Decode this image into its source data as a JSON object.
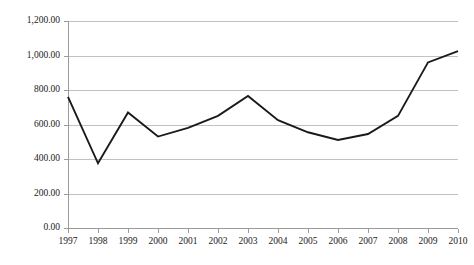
{
  "chart_data": {
    "type": "line",
    "title": "",
    "subtitle": "",
    "xlabel": "",
    "ylabel": "",
    "categories": [
      "1997",
      "1998",
      "1999",
      "2000",
      "2001",
      "2002",
      "2003",
      "2004",
      "2005",
      "2006",
      "2007",
      "2008",
      "2009",
      "2010"
    ],
    "x": [
      1997,
      1998,
      1999,
      2000,
      2001,
      2002,
      2003,
      2004,
      2005,
      2006,
      2007,
      2008,
      2009,
      2010
    ],
    "values": [
      760,
      375,
      670,
      530,
      580,
      650,
      765,
      625,
      555,
      510,
      545,
      650,
      960,
      1025
    ],
    "series": [
      {
        "name": "",
        "color": "#1a1a1a",
        "values": [
          760,
          375,
          670,
          530,
          580,
          650,
          765,
          625,
          555,
          510,
          545,
          650,
          960,
          1025
        ]
      }
    ],
    "ylim": [
      0,
      1200
    ],
    "xlim": [
      1997,
      2010
    ],
    "yticks": [
      0,
      200,
      400,
      600,
      800,
      1000,
      1200
    ],
    "ytick_labels": [
      "0.00",
      "200.00",
      "400.00",
      "600.00",
      "800.00",
      "1,000.00",
      "1,200.00"
    ],
    "xtick_labels": [
      "1997",
      "1998",
      "1999",
      "2000",
      "2001",
      "2002",
      "2003",
      "2004",
      "2005",
      "2006",
      "2007",
      "2008",
      "2009",
      "2010"
    ],
    "grid": {
      "horizontal": true,
      "vertical": false,
      "color": "#b3b3b3"
    },
    "legend": {
      "visible": false,
      "position": "none",
      "entries": []
    },
    "annotations": [],
    "colors": {
      "line": "#1a1a1a",
      "grid": "#b3b3b3",
      "axis": "#9a9a9a",
      "background": "#ffffff",
      "text": "#1a1a1a"
    },
    "plot_area": {
      "left": 68,
      "right": 458,
      "top": 21,
      "bottom": 228
    }
  }
}
